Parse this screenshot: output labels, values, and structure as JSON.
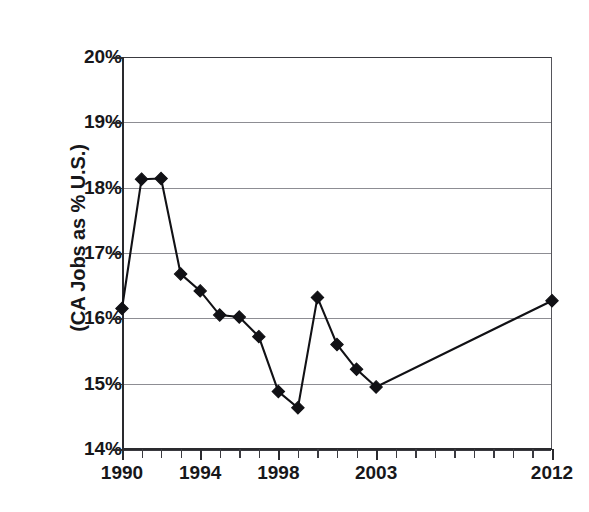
{
  "chart_data": {
    "type": "line",
    "title": "",
    "xlabel": "",
    "ylabel": "(CA Jobs as % U.S.)",
    "x": [
      1990,
      1991,
      1992,
      1993,
      1994,
      1995,
      1996,
      1997,
      1998,
      1999,
      2000,
      2001,
      2002,
      2003,
      2012
    ],
    "values": [
      16.15,
      18.13,
      18.14,
      16.68,
      16.42,
      16.05,
      16.02,
      15.72,
      14.88,
      14.63,
      16.32,
      15.6,
      15.22,
      14.95,
      16.27
    ],
    "series": [
      {
        "name": "CA Jobs as % U.S.",
        "values": [
          16.15,
          18.13,
          18.14,
          16.68,
          16.42,
          16.05,
          16.02,
          15.72,
          14.88,
          14.63,
          16.32,
          15.6,
          15.22,
          14.95,
          16.27
        ]
      }
    ],
    "xlim": [
      1990,
      2012
    ],
    "ylim": [
      14,
      20
    ],
    "ytick_labels": [
      "20%",
      "19%",
      "18%",
      "17%",
      "16%",
      "15%",
      "14%"
    ],
    "ytick_values": [
      20,
      19,
      18,
      17,
      16,
      15,
      14
    ],
    "xtick_labels": [
      "1990",
      "1994",
      "1998",
      "2003",
      "2012"
    ],
    "xtick_values": [
      1990,
      1994,
      1998,
      2003,
      2012
    ],
    "xtick_minor_values": [
      1991,
      1992,
      1993,
      1995,
      1996,
      1997,
      1999,
      2000,
      2001,
      2002,
      2004,
      2005,
      2006,
      2007,
      2008,
      2009,
      2010,
      2011
    ],
    "grid": true,
    "legend": "none",
    "marker": "diamond",
    "line_color": "#111115",
    "marker_color": "#111115",
    "grid_color": "#8d8d93",
    "axis_color": "#2a2a2e",
    "background": "#ffffff"
  }
}
